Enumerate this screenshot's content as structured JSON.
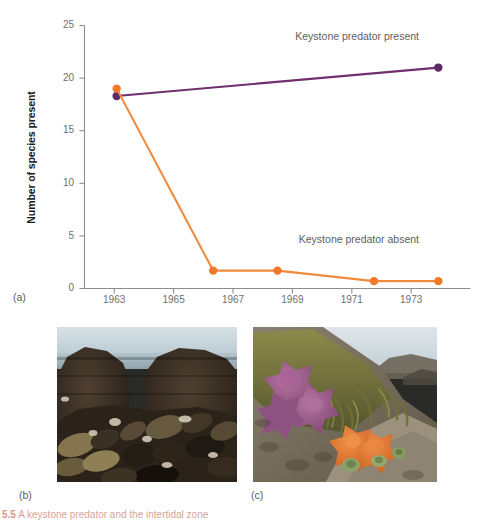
{
  "figure": {
    "panel_tags": {
      "a": "(a)",
      "b": "(b)",
      "c": "(c)"
    },
    "caption_number": "5.5",
    "caption_text": "A keystone predator and the intertidal zone"
  },
  "chart_data": {
    "type": "line",
    "title": "",
    "xlabel": "",
    "ylabel": "Number of species present",
    "xlim": [
      1962,
      1974
    ],
    "ylim": [
      0,
      25
    ],
    "xticks": [
      "1963",
      "1965",
      "1967",
      "1969",
      "1971",
      "1973"
    ],
    "yticks": [
      "0",
      "5",
      "10",
      "15",
      "20",
      "25"
    ],
    "grid": false,
    "legend_position": "inline-annotation",
    "series": [
      {
        "name": "Keystone predator present",
        "color": "#702f6e",
        "marker_color": "#5c2a66",
        "x": [
          1963,
          1973
        ],
        "values": [
          18.3,
          21.0
        ]
      },
      {
        "name": "Keystone predator absent",
        "color": "#f08a3c",
        "marker_color": "#f2792a",
        "x": [
          1963,
          1966,
          1968,
          1971,
          1973
        ],
        "values": [
          19.0,
          1.7,
          1.7,
          0.7,
          0.7
        ]
      }
    ],
    "annotations": [
      {
        "text": "Keystone predator present",
        "x": 1972.4,
        "y": 23.6
      },
      {
        "text": "Keystone predator absent",
        "x": 1972.4,
        "y": 4.3
      }
    ]
  },
  "photos": {
    "b": {
      "alt": "Dense dark mussel bed covering intertidal rocks, sea and sky in background",
      "sky_color": "#cfd9dd",
      "water_color": "#a9bcc4",
      "mussel_dark": "#211b16",
      "mussel_mid": "#4a3b2b",
      "mussel_light": "#9c8c63"
    },
    "c": {
      "alt": "Purple and orange ochre sea stars clustered on a rocky shore with seaweed",
      "sky_color": "#c9d3da",
      "rock_color": "#7a6e5c",
      "seaweed_color": "#7b7a45",
      "star_purple": "#9c5d88",
      "star_orange": "#e2782e",
      "anemone_green": "#8aa06a"
    }
  }
}
